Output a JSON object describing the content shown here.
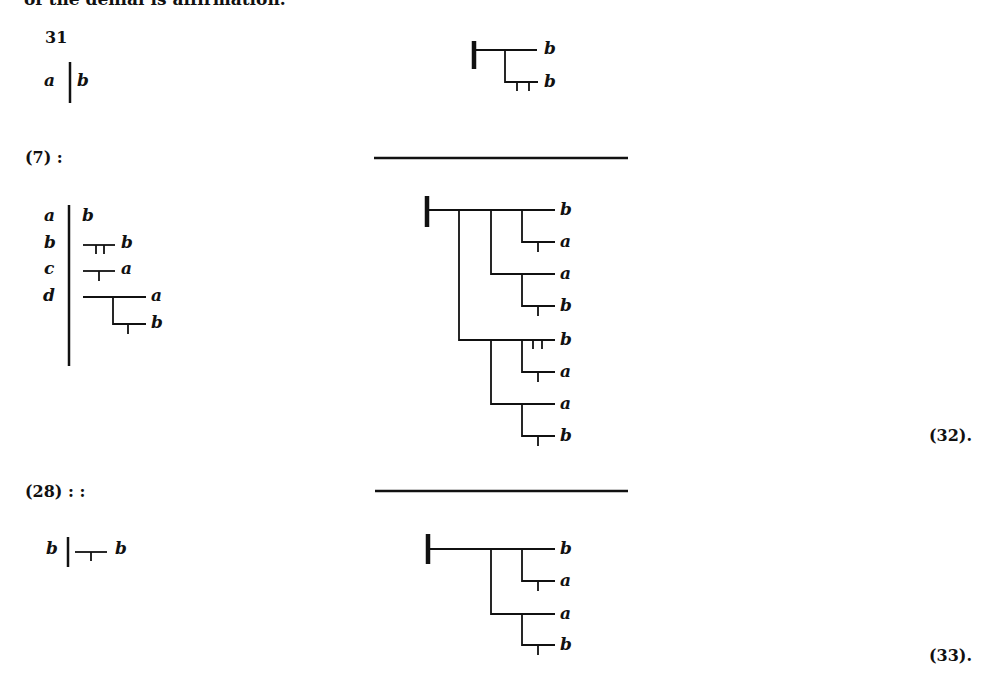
{
  "page": {
    "cut_off_heading": "of the denial is affirmation."
  },
  "block31": {
    "number": "31",
    "left_var": "a",
    "right_var": "b",
    "formula_labels": [
      "b",
      "b"
    ]
  },
  "block7": {
    "ref": "(7) :",
    "substitutions": [
      {
        "var": "a",
        "value": "b"
      },
      {
        "var": "b",
        "value": "b"
      },
      {
        "var": "c",
        "value": "a"
      },
      {
        "var": "d",
        "value_top": "a",
        "value_bottom": "b"
      }
    ],
    "formula_labels": [
      "b",
      "a",
      "a",
      "b",
      "b",
      "a",
      "a",
      "b"
    ],
    "equation_number": "(32)."
  },
  "block28": {
    "ref": "(28) : :",
    "left_var": "b",
    "right_var": "b",
    "formula_labels": [
      "b",
      "a",
      "a",
      "b"
    ],
    "equation_number": "(33)."
  }
}
